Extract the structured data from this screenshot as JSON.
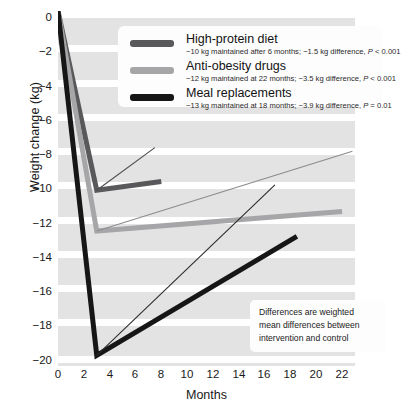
{
  "figure": {
    "background_color": "#ffffff",
    "panel_color": "#e3e3e3",
    "gridline_color": "#ffffff"
  },
  "axes": {
    "ylabel": "Weight change (kg)",
    "xlabel": "Months",
    "yticks": [
      "0",
      "−2",
      "−4",
      "−6",
      "−8",
      "−10",
      "−12",
      "−14",
      "−16",
      "−18",
      "−20"
    ],
    "ytick_values": [
      0,
      -2,
      -4,
      -6,
      -8,
      -10,
      -12,
      -14,
      -16,
      -18,
      -20
    ],
    "xticks": [
      "0",
      "2",
      "4",
      "6",
      "8",
      "10",
      "12",
      "14",
      "16",
      "18",
      "20",
      "22"
    ],
    "xtick_values": [
      0,
      2,
      4,
      6,
      8,
      10,
      12,
      14,
      16,
      18,
      20,
      22
    ]
  },
  "legend": {
    "items": [
      {
        "label": "High-protein diet",
        "detail_pre": "−10 kg maintained after 6 months; −1.5 kg difference, ",
        "detail_ital": "P",
        "detail_post": " < 0.001",
        "color": "#59595b"
      },
      {
        "label": "Anti-obesity drugs",
        "detail_pre": "−12 kg maintained at 22 months; −3.5 kg difference, ",
        "detail_ital": "P",
        "detail_post": " < 0.001",
        "color": "#a6a6a8"
      },
      {
        "label": "Meal replacements",
        "detail_pre": "−13 kg maintained at 18 months; −3.9 kg difference, ",
        "detail_ital": "P",
        "detail_post": " = 0.01",
        "color": "#161616"
      }
    ]
  },
  "note": {
    "lines": [
      "Differences are weighted",
      "mean differences between",
      "intervention and control"
    ]
  },
  "chart_data": {
    "type": "line",
    "title": "",
    "xlabel": "Months",
    "ylabel": "Weight change (kg)",
    "xlim": [
      0,
      23
    ],
    "ylim": [
      -20,
      0
    ],
    "grid": true,
    "legend_position": "top-right-inside",
    "series": [
      {
        "name": "High-protein diet",
        "color": "#59595b",
        "width": 5,
        "x": [
          0,
          3,
          8
        ],
        "y": [
          0,
          -10.1,
          -9.6
        ]
      },
      {
        "name": "Anti-obesity drugs",
        "color": "#a6a6a8",
        "width": 5,
        "x": [
          0,
          3,
          22
        ],
        "y": [
          0,
          -12.4,
          -11.3
        ]
      },
      {
        "name": "Meal replacements",
        "color": "#161616",
        "width": 5,
        "x": [
          0,
          3,
          18.5
        ],
        "y": [
          0,
          -19.4,
          -12.7
        ]
      },
      {
        "name": "Control (high-protein diet)",
        "color": "#4d4d4d",
        "width": 1.1,
        "x": [
          3,
          7.5
        ],
        "y": [
          -10.1,
          -7.7
        ]
      },
      {
        "name": "Control (anti-obesity drugs)",
        "color": "#8c8c8c",
        "width": 1.1,
        "x": [
          3,
          22.8
        ],
        "y": [
          -12.4,
          -7.9
        ]
      },
      {
        "name": "Control (meal replacements)",
        "color": "#2b2b2b",
        "width": 1.1,
        "x": [
          3,
          16.8
        ],
        "y": [
          -19.4,
          -9.8
        ]
      }
    ]
  }
}
